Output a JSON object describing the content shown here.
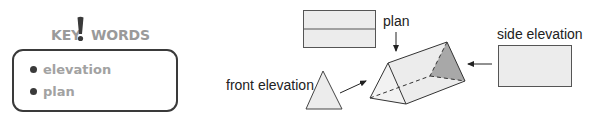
{
  "keywords": {
    "title_left": "KEY",
    "title_mark": "!",
    "title_right": "WORDS",
    "items": [
      {
        "label": "elevation"
      },
      {
        "label": "plan"
      }
    ]
  },
  "diagram": {
    "labels": {
      "front_elevation": "front elevation",
      "plan": "plan",
      "side_elevation": "side elevation"
    },
    "colors": {
      "outline": "#333333",
      "light_fill": "#ececec",
      "shaded_face": "#a8a8a8",
      "keyword_text": "#a2a2a2",
      "keyword_border": "#3a3a3a"
    },
    "views": [
      {
        "name": "plan",
        "shape": "rectangle-split-horizontal"
      },
      {
        "name": "front elevation",
        "shape": "triangle"
      },
      {
        "name": "side elevation",
        "shape": "rectangle"
      }
    ],
    "solid": "triangular prism"
  }
}
